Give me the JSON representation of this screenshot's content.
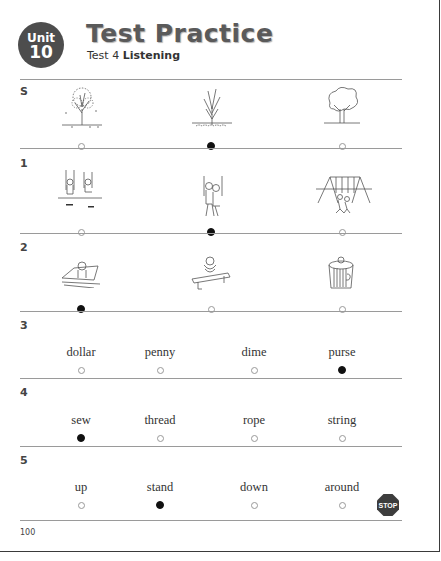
{
  "header": {
    "unit_label": "Unit",
    "unit_number": "10",
    "title": "Test Practice",
    "subtitle_prefix": "Test 4",
    "subtitle_bold": "Listening"
  },
  "questions": [
    {
      "number": "S",
      "type": "picture",
      "options": [
        {
          "picture": "tree-losing-leaves",
          "selected": false
        },
        {
          "picture": "bare-tree-leaves-on-ground",
          "selected": true
        },
        {
          "picture": "full-leafy-tree",
          "selected": false
        }
      ]
    },
    {
      "number": "1",
      "type": "picture",
      "options": [
        {
          "picture": "two-kids-on-swings",
          "selected": false
        },
        {
          "picture": "two-kids-on-one-swing",
          "selected": true
        },
        {
          "picture": "swing-set-with-kids",
          "selected": false
        }
      ]
    },
    {
      "number": "2",
      "type": "picture",
      "options": [
        {
          "picture": "animal-on-slanted-board",
          "selected": true
        },
        {
          "picture": "animal-on-bench",
          "selected": false
        },
        {
          "picture": "animal-in-trash-can",
          "selected": false
        }
      ]
    },
    {
      "number": "3",
      "type": "word",
      "options": [
        {
          "word": "dollar",
          "selected": false
        },
        {
          "word": "penny",
          "selected": false
        },
        {
          "word": "dime",
          "selected": false
        },
        {
          "word": "purse",
          "selected": true
        }
      ]
    },
    {
      "number": "4",
      "type": "word",
      "options": [
        {
          "word": "sew",
          "selected": true
        },
        {
          "word": "thread",
          "selected": false
        },
        {
          "word": "rope",
          "selected": false
        },
        {
          "word": "string",
          "selected": false
        }
      ]
    },
    {
      "number": "5",
      "type": "word",
      "options": [
        {
          "word": "up",
          "selected": false
        },
        {
          "word": "stand",
          "selected": true
        },
        {
          "word": "down",
          "selected": false
        },
        {
          "word": "around",
          "selected": false
        }
      ]
    }
  ],
  "stop_sign": {
    "label": "STOP",
    "color": "#3d3d3d"
  },
  "footer": {
    "page_number": "100"
  },
  "colors": {
    "badge": "#4d4d4d",
    "title": "#5a5a5a",
    "rule": "#9a9a9a"
  }
}
